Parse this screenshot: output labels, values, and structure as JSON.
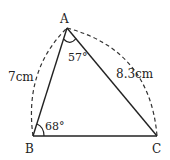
{
  "diagram": {
    "type": "triangle",
    "vertices": {
      "A": {
        "label": "A",
        "x": 67,
        "y": 28
      },
      "B": {
        "label": "B",
        "x": 33,
        "y": 136
      },
      "C": {
        "label": "C",
        "x": 157,
        "y": 136
      }
    },
    "angles": {
      "A": {
        "label": "57°"
      },
      "B": {
        "label": "68°"
      }
    },
    "sides": {
      "AB": {
        "label": "7cm"
      },
      "AC": {
        "label": "8.3cm"
      }
    },
    "colors": {
      "stroke": "#222222",
      "background": "#ffffff"
    }
  }
}
